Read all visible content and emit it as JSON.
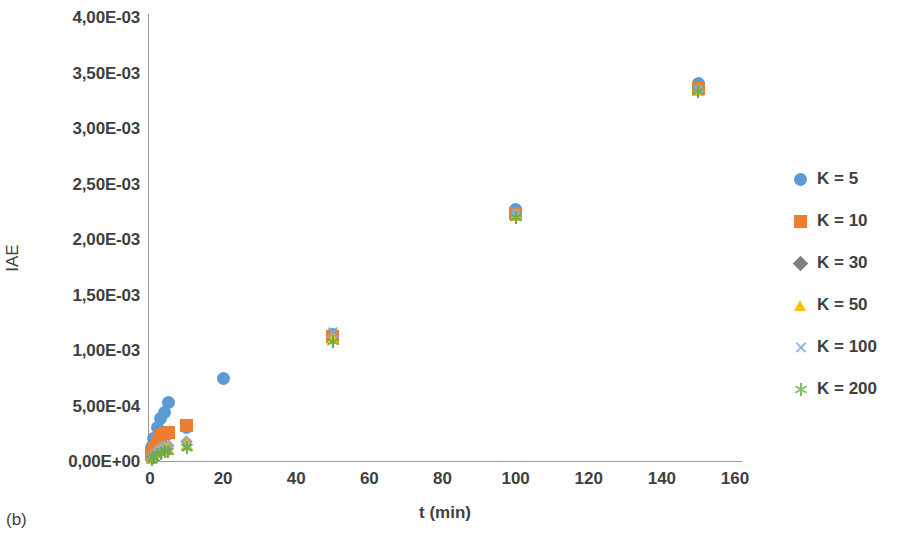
{
  "caption": "(b)",
  "chart_data": {
    "type": "scatter",
    "title": "",
    "xlabel": "t (min)",
    "ylabel": "IAE",
    "xlim": [
      0,
      160
    ],
    "ylim": [
      0,
      0.004
    ],
    "grid": false,
    "legend_position": "right",
    "xticks": [
      0,
      20,
      40,
      60,
      80,
      100,
      120,
      140,
      160
    ],
    "xtick_labels": [
      "0",
      "20",
      "40",
      "60",
      "80",
      "100",
      "120",
      "140",
      "160"
    ],
    "yticks": [
      0,
      0.0005,
      0.001,
      0.0015,
      0.002,
      0.0025,
      0.003,
      0.0035,
      0.004
    ],
    "ytick_labels": [
      "0,00E+00",
      "5,00E-04",
      "1,00E-03",
      "1,50E-03",
      "2,00E-03",
      "2,50E-03",
      "3,00E-03",
      "3,50E-03",
      "4,00E-03"
    ],
    "series": [
      {
        "name": "K = 5",
        "marker": "circle",
        "color": "#5B9BD5",
        "x": [
          0.5,
          1,
          2,
          3,
          4,
          5,
          10,
          20,
          50,
          100,
          150
        ],
        "y": [
          0.00012,
          0.0002,
          0.0003,
          0.00038,
          0.00044,
          0.00053,
          0.0003,
          0.000745,
          0.00114,
          0.00227,
          0.0034
        ]
      },
      {
        "name": "K = 10",
        "marker": "square",
        "color": "#ED7D31",
        "x": [
          0.5,
          1,
          2,
          3,
          4,
          5,
          10,
          50,
          100,
          150
        ],
        "y": [
          6e-05,
          0.00011,
          0.00018,
          0.00023,
          0.00025,
          0.00026,
          0.00032,
          0.00112,
          0.00223,
          0.00336
        ]
      },
      {
        "name": "K = 30",
        "marker": "diamond",
        "color": "#A5A5A5",
        "x": [
          0.5,
          1,
          2,
          3,
          4,
          5,
          10,
          50,
          100,
          150
        ],
        "y": [
          3e-05,
          6e-05,
          9.5e-05,
          0.00012,
          0.000135,
          0.000145,
          0.000175,
          0.00111,
          0.00222,
          0.00335
        ]
      },
      {
        "name": "K = 50",
        "marker": "triangle",
        "color": "#FFC000",
        "x": [
          0.5,
          1,
          2,
          3,
          4,
          5,
          10,
          50,
          100,
          150
        ],
        "y": [
          2.5e-05,
          5e-05,
          8e-05,
          0.0001,
          0.000112,
          0.00012,
          0.00015,
          0.001105,
          0.002215,
          0.003345
        ]
      },
      {
        "name": "K = 100",
        "marker": "x",
        "color": "#7CA9DD",
        "x": [
          0.5,
          1,
          2,
          3,
          4,
          5,
          10,
          50,
          100,
          150
        ],
        "y": [
          2e-05,
          4e-05,
          6.5e-05,
          8.5e-05,
          9.5e-05,
          0.000102,
          0.00013,
          0.001165,
          0.00223,
          0.00335
        ]
      },
      {
        "name": "K = 200",
        "marker": "asterisk",
        "color": "#70AD47",
        "x": [
          0.5,
          1,
          2,
          3,
          4,
          5,
          10,
          50,
          100,
          150
        ],
        "y": [
          1.5e-05,
          3.2e-05,
          5.5e-05,
          7.2e-05,
          8.2e-05,
          9e-05,
          0.000118,
          0.00108,
          0.002195,
          0.00333
        ]
      }
    ]
  },
  "legend": {
    "items": [
      {
        "label": "K = 5",
        "marker": "circle",
        "color": "#5B9BD5"
      },
      {
        "label": "K = 10",
        "marker": "square",
        "color": "#ED7D31"
      },
      {
        "label": "K = 30",
        "marker": "diamond",
        "color": "#808080"
      },
      {
        "label": "K = 50",
        "marker": "triangle",
        "color": "#FFC000"
      },
      {
        "label": "K = 100",
        "marker": "x",
        "color": "#8FB4DE"
      },
      {
        "label": "K = 200",
        "marker": "asterisk",
        "color": "#7FBF5F"
      }
    ]
  }
}
